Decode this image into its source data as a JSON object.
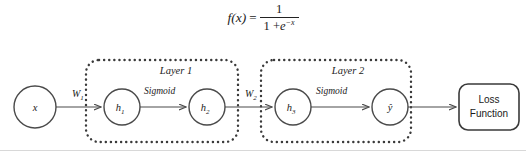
{
  "figure": {
    "formula": {
      "lhs": "f(x)",
      "equals": "=",
      "numerator": "1",
      "denominator_lead": "1 +",
      "denominator_base": "e",
      "denominator_exponent": "−x",
      "plain_text": "f(x) = 1 / (1 + e^-x)"
    },
    "colors": {
      "background": "#ffffff",
      "stroke": "#4a4a4a",
      "dotted_stroke": "#3a3a3a",
      "text": "#1a1a1a"
    },
    "nodes": [
      {
        "id": "input",
        "label": "x",
        "sub": "",
        "cx": 35,
        "cy": 107,
        "r": 21
      },
      {
        "id": "h1",
        "label": "h",
        "sub": "1",
        "cx": 122,
        "cy": 107,
        "r": 18
      },
      {
        "id": "h2",
        "label": "h",
        "sub": "2",
        "cx": 207,
        "cy": 107,
        "r": 18
      },
      {
        "id": "h3",
        "label": "h",
        "sub": "3",
        "cx": 293,
        "cy": 107,
        "r": 18
      },
      {
        "id": "yhat",
        "label": "ŷ",
        "sub": "",
        "cx": 390,
        "cy": 107,
        "r": 18
      }
    ],
    "edge_labels": [
      {
        "id": "w1",
        "label": "W",
        "sub": "1",
        "x": 72,
        "y": 97
      },
      {
        "id": "w2",
        "label": "W",
        "sub": "2",
        "x": 245,
        "y": 97
      }
    ],
    "activations": [
      {
        "id": "sigmoid-1",
        "label": "Sigmoid",
        "x": 144,
        "y": 94
      },
      {
        "id": "sigmoid-2",
        "label": "Sigmoid",
        "x": 316,
        "y": 94
      }
    ],
    "layers": [
      {
        "id": "layer-1",
        "label": "Layer 1",
        "x": 86,
        "y": 60,
        "w": 152,
        "h": 82,
        "label_x": 176,
        "label_y": 74
      },
      {
        "id": "layer-2",
        "label": "Layer 2",
        "x": 261,
        "y": 60,
        "w": 150,
        "h": 82,
        "label_x": 348,
        "label_y": 74
      }
    ],
    "loss_box": {
      "id": "loss-function",
      "line1": "Loss",
      "line2": "Function",
      "x": 459,
      "y": 84,
      "w": 60,
      "h": 46
    }
  }
}
